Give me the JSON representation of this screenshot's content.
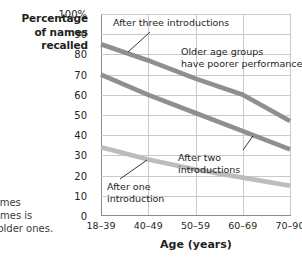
{
  "chart_data": {
    "type": "line",
    "title": "",
    "xlabel": "Age (years)",
    "ylabel": "Percentage of names recalled",
    "categories": [
      "18–39",
      "40–49",
      "50–59",
      "60–69",
      "70–90"
    ],
    "ylim": [
      0,
      100
    ],
    "yticks": [
      "0",
      "10",
      "20",
      "30",
      "40",
      "50",
      "60",
      "70",
      "80",
      "90",
      "100%"
    ],
    "ytick_values": [
      0,
      10,
      20,
      30,
      40,
      50,
      60,
      70,
      80,
      90,
      100
    ],
    "grid": true,
    "legend_position": "inline-annotations",
    "series": [
      {
        "name": "After three introductions",
        "color": "#8f8f8f",
        "values": [
          85,
          77,
          68,
          60,
          47
        ]
      },
      {
        "name": "After two introductions",
        "color": "#8f8f8f",
        "values": [
          70,
          60,
          51,
          42,
          33
        ]
      },
      {
        "name": "After one introduction",
        "color": "#bcbcbc",
        "values": [
          34,
          28,
          23,
          19,
          15
        ]
      }
    ],
    "annotations": [
      {
        "id": "after-three",
        "text": "After three introductions"
      },
      {
        "id": "older-groups",
        "text": "Older age groups\nhave poorer performance"
      },
      {
        "id": "after-two",
        "text": "After two\nintroductions"
      },
      {
        "id": "after-one",
        "text": "After one\nintroduction"
      }
    ]
  },
  "axis": {
    "y_title_lines": "Percentage\nof names\nrecalled",
    "x_title": "Age (years)"
  },
  "caption": {
    "text": " names\ne times is\nor older ones.\n)"
  },
  "colors": {
    "line_dark": "#8f8f8f",
    "line_light": "#bcbcbc",
    "grid": "#c9c9c9",
    "axis": "#8c8c8c",
    "text": "#231f20"
  }
}
